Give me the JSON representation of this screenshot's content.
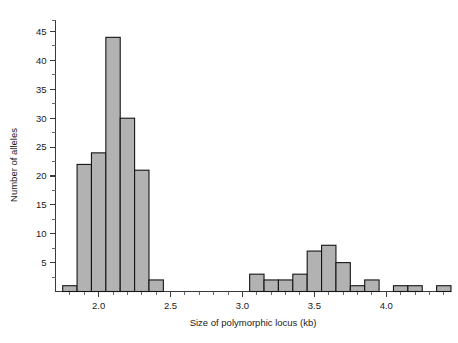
{
  "chart_data": {
    "type": "bar",
    "title": "",
    "subtitle": "",
    "xlabel": "Size of polymorphic locus (kb)",
    "ylabel": "Number of alleles",
    "xlim": [
      1.7,
      4.45
    ],
    "ylim": [
      0,
      47
    ],
    "bin_width": 0.1,
    "grid": false,
    "legend": null,
    "annotations": [],
    "x_ticks_major": [
      "2.0",
      "2.5",
      "3.0",
      "3.5",
      "4.0"
    ],
    "x_ticks_major_values": [
      2.0,
      2.5,
      3.0,
      3.5,
      4.0
    ],
    "x_ticks_minor_values": [
      1.8,
      1.9,
      2.1,
      2.2,
      2.3,
      2.4,
      2.6,
      2.7,
      2.8,
      2.9,
      3.1,
      3.2,
      3.3,
      3.4,
      3.6,
      3.7,
      3.8,
      3.9,
      4.1,
      4.2,
      4.3,
      4.4
    ],
    "y_ticks_major": [
      "5",
      "10",
      "15",
      "20",
      "25",
      "30",
      "35",
      "40",
      "45"
    ],
    "y_ticks_major_values": [
      5,
      10,
      15,
      20,
      25,
      30,
      35,
      40,
      45
    ],
    "y_ticks_minor_values": [
      2.5,
      7.5,
      12.5,
      17.5,
      22.5,
      27.5,
      32.5,
      37.5,
      42.5,
      47
    ],
    "bin_starts": [
      1.75,
      1.85,
      1.95,
      2.05,
      2.15,
      2.25,
      2.35,
      3.05,
      3.15,
      3.25,
      3.35,
      3.45,
      3.55,
      3.65,
      3.75,
      3.85,
      4.05,
      4.15,
      4.35
    ],
    "values": [
      1,
      22,
      24,
      44,
      30,
      21,
      2,
      3,
      2,
      2,
      3,
      7,
      8,
      5,
      1,
      2,
      1,
      1,
      1
    ],
    "colors": {
      "bar_fill": "#b2b2b2",
      "bar_edge": "#141414",
      "axis": "#3a3a3a",
      "text": "#1a1a1a",
      "background": "#ffffff"
    }
  }
}
